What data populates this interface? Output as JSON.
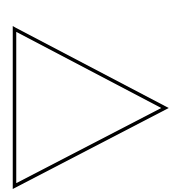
{
  "canvas": {
    "width": 175,
    "height": 193,
    "background": "#ffffff"
  },
  "shape": {
    "type": "triangle",
    "orientation": "right-pointing",
    "points": "14.5,29 165,108 14.5,186",
    "stroke": "#000000",
    "stroke_width": 3.5,
    "fill": "#ffffff"
  }
}
